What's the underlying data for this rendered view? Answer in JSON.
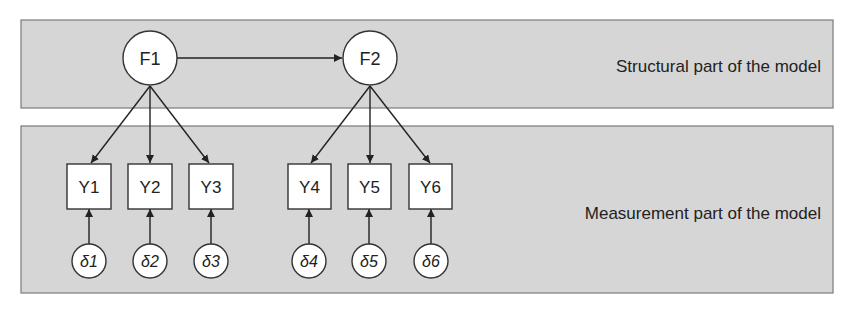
{
  "colors": {
    "panel_fill": "#d6d6d6",
    "panel_border": "#7a7a7a",
    "node_fill": "#ffffff",
    "stroke": "#222222"
  },
  "panels": {
    "structural": {
      "label": "Structural part of the model"
    },
    "measurement": {
      "label": "Measurement part of the model"
    }
  },
  "latent": [
    {
      "id": "F1",
      "label": "F1"
    },
    {
      "id": "F2",
      "label": "F2"
    }
  ],
  "observed": [
    {
      "id": "Y1",
      "label": "Y1"
    },
    {
      "id": "Y2",
      "label": "Y2"
    },
    {
      "id": "Y3",
      "label": "Y3"
    },
    {
      "id": "Y4",
      "label": "Y4"
    },
    {
      "id": "Y5",
      "label": "Y5"
    },
    {
      "id": "Y6",
      "label": "Y6"
    }
  ],
  "errors": [
    {
      "id": "d1",
      "label": "δ1"
    },
    {
      "id": "d2",
      "label": "δ2"
    },
    {
      "id": "d3",
      "label": "δ3"
    },
    {
      "id": "d4",
      "label": "δ4"
    },
    {
      "id": "d5",
      "label": "δ5"
    },
    {
      "id": "d6",
      "label": "δ6"
    }
  ],
  "edges": [
    {
      "from": "F1",
      "to": "F2"
    },
    {
      "from": "F1",
      "to": "Y1"
    },
    {
      "from": "F1",
      "to": "Y2"
    },
    {
      "from": "F1",
      "to": "Y3"
    },
    {
      "from": "F2",
      "to": "Y4"
    },
    {
      "from": "F2",
      "to": "Y5"
    },
    {
      "from": "F2",
      "to": "Y6"
    },
    {
      "from": "d1",
      "to": "Y1"
    },
    {
      "from": "d2",
      "to": "Y2"
    },
    {
      "from": "d3",
      "to": "Y3"
    },
    {
      "from": "d4",
      "to": "Y4"
    },
    {
      "from": "d5",
      "to": "Y5"
    },
    {
      "from": "d6",
      "to": "Y6"
    }
  ]
}
